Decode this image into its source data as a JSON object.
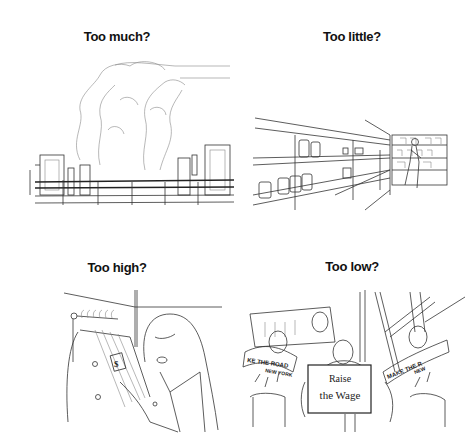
{
  "panels": [
    {
      "title": "Too much?",
      "illustration": "industrial city skyline with smoke plumes"
    },
    {
      "title": "Too little?",
      "illustration": "nearly empty store shelves with shopper"
    },
    {
      "title": "Too high?",
      "illustration": "shocked woman looking at price tag on coat rack"
    },
    {
      "title": "Too low?",
      "illustration": "protest crowd with signs and banners",
      "sign_line1": "Raise",
      "sign_line2": "the Wage",
      "banner_left_line1": "KE THE ROAD",
      "banner_left_line2": "NEW YORK",
      "banner_right_line1": "MAKE THE R",
      "banner_right_line2": "NEW"
    }
  ]
}
